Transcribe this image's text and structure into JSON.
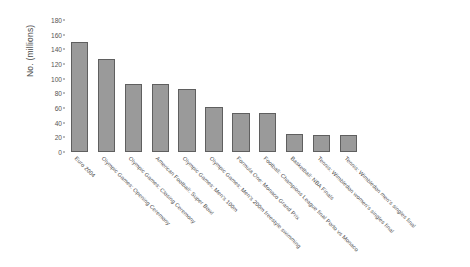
{
  "chart_data": {
    "type": "bar",
    "title": "",
    "xlabel": "",
    "ylabel": "No. (millions)",
    "ylim": [
      0,
      180
    ],
    "ytick_values": [
      0,
      20,
      40,
      60,
      80,
      100,
      120,
      140,
      160,
      180
    ],
    "ytick_labels": [
      "0",
      "20",
      "40",
      "60",
      "80",
      "100",
      "120",
      "140",
      "160",
      "180"
    ],
    "grid": false,
    "legend": "none",
    "xtick_rotation_degrees": 45,
    "bar_color": "#9a9a9a",
    "bar_border_color": "#5f5f5f",
    "categories": [
      "Euro 2004",
      "Olympic Games: Opening Ceremony",
      "Olympic Games: Closing Ceremony",
      "American Football: Super Bowl",
      "Olympic Games: Men's 100m",
      "Olympic Games: Men's 200m freestyle swimming",
      "Formula One: Monaco Grand Prix",
      "Football: Champions League final Porto vs Monaco",
      "Basketball: NBA Finals",
      "Tennis: Wimbledon women's singles final",
      "Tennis: Wimbledon men's singles final"
    ],
    "values": [
      150,
      127,
      93,
      93,
      86,
      61,
      53,
      53,
      25,
      23,
      23
    ]
  }
}
